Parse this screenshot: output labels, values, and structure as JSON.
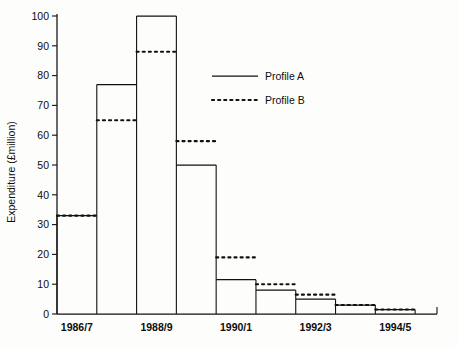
{
  "chart_data": {
    "type": "line",
    "subtype": "step-profile",
    "title": "",
    "xlabel": "",
    "ylabel": "Expenditure (£million)",
    "ylim": [
      0,
      100
    ],
    "ytick_step": 10,
    "yticks": [
      0,
      10,
      20,
      30,
      40,
      50,
      60,
      70,
      80,
      90,
      100
    ],
    "ytick_labels": [
      "0",
      "10",
      "20",
      "30",
      "40",
      "50",
      "60",
      "70",
      "80",
      "90",
      "100"
    ],
    "grid": false,
    "categories": [
      "1986/7",
      "1987/8",
      "1988/9",
      "1989/90",
      "1990/1",
      "1991/2",
      "1992/3",
      "1993/4",
      "1994/5"
    ],
    "visible_xtick_labels": [
      "1986/7",
      "1988/9",
      "1990/1",
      "1992/3",
      "1994/5"
    ],
    "xtick_label_indices": [
      0,
      2,
      4,
      6,
      8
    ],
    "legend_position": "upper-center-right",
    "series": [
      {
        "name": "Profile A",
        "style": "solid",
        "color": "#111111",
        "values": [
          33,
          77,
          100,
          50,
          11.5,
          8,
          5,
          3,
          1.5
        ]
      },
      {
        "name": "Profile B",
        "style": "dotted",
        "color": "#111111",
        "values": [
          33,
          65,
          88,
          58,
          19,
          10,
          6.5,
          3,
          1.5
        ]
      }
    ]
  },
  "legend": {
    "entries": [
      {
        "label": "Profile A",
        "marker": "solid-line"
      },
      {
        "label": "Profile B",
        "marker": "dotted-line"
      }
    ]
  }
}
